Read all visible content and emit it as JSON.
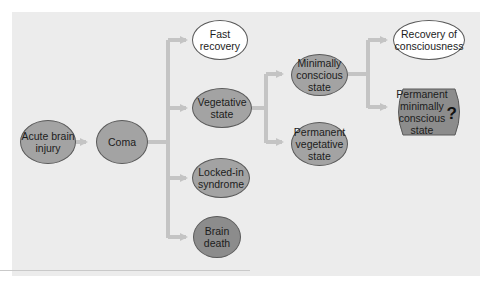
{
  "diagram": {
    "colors": {
      "panel_bg": "#ececec",
      "arrow": "#c4c4c4",
      "node_white": "#ffffff",
      "node_mid": "#a3a3a3",
      "node_dark": "#8c8c8c",
      "outline": "#5a5a5a"
    },
    "nodes": {
      "acute": {
        "label": "Acute brain\ninjury",
        "fill": "mid"
      },
      "coma": {
        "label": "Coma",
        "fill": "mid"
      },
      "fast": {
        "label": "Fast\nrecovery",
        "fill": "white"
      },
      "vegetative": {
        "label": "Vegetative\nstate",
        "fill": "mid"
      },
      "locked": {
        "label": "Locked-in\nsyndrome",
        "fill": "mid"
      },
      "brain_death": {
        "label": "Brain\ndeath",
        "fill": "dark"
      },
      "mcs": {
        "label": "Minimally\nconscious\nstate",
        "fill": "mid"
      },
      "pvs": {
        "label": "Permanent\nvegetative\nstate",
        "fill": "mid"
      },
      "recovery": {
        "label": "Recovery of\nconsciousness",
        "fill": "white"
      },
      "pmcs": {
        "label": "Permanent\nminimally\nconscious\nstate",
        "fill": "dark",
        "marker": "?"
      }
    },
    "edges": [
      {
        "from": "acute",
        "to": "coma"
      },
      {
        "from": "coma",
        "to": "fast"
      },
      {
        "from": "coma",
        "to": "vegetative"
      },
      {
        "from": "coma",
        "to": "locked"
      },
      {
        "from": "coma",
        "to": "brain_death"
      },
      {
        "from": "vegetative",
        "to": "mcs"
      },
      {
        "from": "vegetative",
        "to": "pvs"
      },
      {
        "from": "mcs",
        "to": "recovery"
      },
      {
        "from": "mcs",
        "to": "pmcs"
      }
    ]
  }
}
